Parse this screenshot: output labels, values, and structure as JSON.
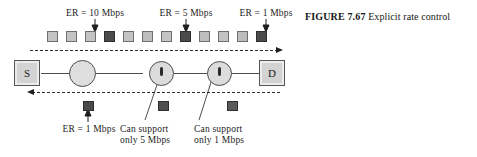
{
  "figure": {
    "number_label": "FIGURE 7.67",
    "caption_text": "Explicit rate control"
  },
  "nodes": {
    "source_label": "S",
    "destination_label": "D"
  },
  "top_labels": [
    {
      "id": "er-10",
      "text": "ER = 10 Mbps"
    },
    {
      "id": "er-5",
      "text": "ER = 5 Mbps"
    },
    {
      "id": "er-1",
      "text": "ER = 1 Mbps"
    }
  ],
  "bottom_labels": [
    {
      "id": "er-1-return",
      "line1": "ER = 1 Mbps",
      "line2": ""
    },
    {
      "id": "router2-cap",
      "line1": "Can support",
      "line2": "only 5 Mbps"
    },
    {
      "id": "router3-cap",
      "line1": "Can support",
      "line2": "only 1 Mbps"
    }
  ],
  "forward_cells": [
    {
      "shade": "light"
    },
    {
      "shade": "light"
    },
    {
      "shade": "light"
    },
    {
      "shade": "dark"
    },
    {
      "shade": "light"
    },
    {
      "shade": "light2"
    },
    {
      "shade": "light"
    },
    {
      "shade": "dark"
    },
    {
      "shade": "light2"
    },
    {
      "shade": "light"
    },
    {
      "shade": "light2"
    },
    {
      "shade": "dark"
    }
  ],
  "return_cells": [
    {
      "shade": "dark"
    },
    {
      "shade": "mid"
    },
    {
      "shade": "gray"
    }
  ],
  "colors": {
    "cell_light": "#c3c3c3",
    "cell_dark": "#4a4a4a",
    "node_fill": "#d3d3d3",
    "router_fill": "#dcdcdc",
    "line": "#4d4d4d",
    "text": "#1a1a1a"
  },
  "flow": {
    "forward_direction": "right",
    "return_direction": "left"
  }
}
